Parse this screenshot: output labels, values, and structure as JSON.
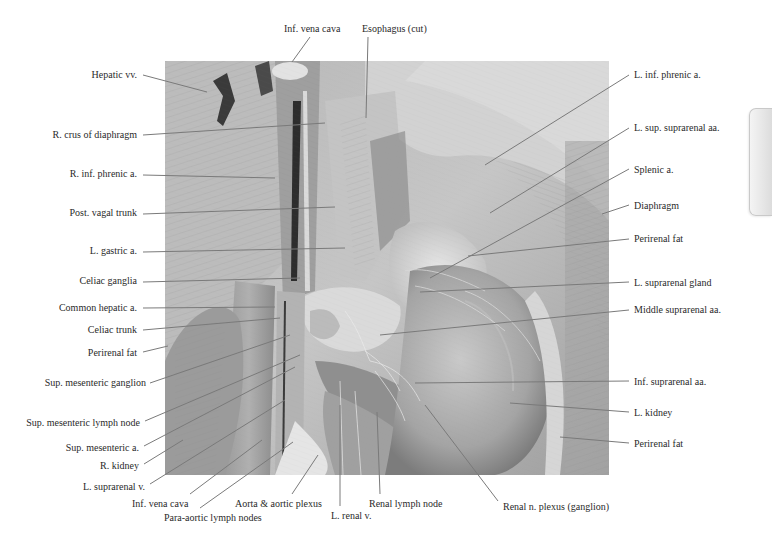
{
  "figure": {
    "type": "anatomical dissection photograph",
    "photo_bounds": {
      "x": 165,
      "y": 61,
      "width": 444,
      "height": 414
    }
  },
  "labels": {
    "top": [
      {
        "text": "Inf. vena cava",
        "x": 284,
        "y": 23,
        "anchor": "left",
        "line": [
          310,
          37,
          292,
          62
        ]
      },
      {
        "text": "Esophagus (cut)",
        "x": 362,
        "y": 23,
        "anchor": "left",
        "line": [
          368,
          37,
          366,
          118
        ]
      }
    ],
    "left": [
      {
        "text": "Hepatic vv.",
        "x": 137,
        "y": 69,
        "anchor": "right",
        "line": [
          143,
          75,
          207,
          92
        ]
      },
      {
        "text": "R. crus of diaphragm",
        "x": 137,
        "y": 129,
        "anchor": "right",
        "line": [
          143,
          135,
          325,
          123
        ]
      },
      {
        "text": "R. inf. phrenic a.",
        "x": 137,
        "y": 168,
        "anchor": "right",
        "line": [
          143,
          175,
          275,
          178
        ]
      },
      {
        "text": "Post. vagal trunk",
        "x": 137,
        "y": 207,
        "anchor": "right",
        "line": [
          143,
          214,
          335,
          207
        ]
      },
      {
        "text": "L. gastric a.",
        "x": 137,
        "y": 245,
        "anchor": "right",
        "line": [
          143,
          252,
          345,
          248
        ]
      },
      {
        "text": "Celiac ganglia",
        "x": 137,
        "y": 275,
        "anchor": "right",
        "line": [
          143,
          282,
          300,
          278
        ]
      },
      {
        "text": "Common hepatic a.",
        "x": 137,
        "y": 302,
        "anchor": "right",
        "line": [
          143,
          308,
          275,
          307
        ]
      },
      {
        "text": "Celiac trunk",
        "x": 137,
        "y": 324,
        "anchor": "right",
        "line": [
          143,
          330,
          280,
          318
        ]
      },
      {
        "text": "Perirenal fat",
        "x": 137,
        "y": 347,
        "anchor": "right",
        "line": [
          143,
          352,
          168,
          346
        ]
      },
      {
        "text": "Sup. mesenteric ganglion",
        "x": 146,
        "y": 377,
        "anchor": "right",
        "line": [
          150,
          383,
          290,
          335
        ]
      },
      {
        "text": "Sup. mesenteric lymph node",
        "x": 140,
        "y": 417,
        "anchor": "right",
        "line": [
          145,
          421,
          300,
          355
        ]
      },
      {
        "text": "Sup. mesenteric a.",
        "x": 139,
        "y": 442,
        "anchor": "right",
        "line": [
          144,
          446,
          295,
          367
        ]
      },
      {
        "text": "R. kidney",
        "x": 139,
        "y": 460,
        "anchor": "right",
        "line": [
          144,
          464,
          183,
          440
        ]
      },
      {
        "text": "L. suprarenal v.",
        "x": 145,
        "y": 481,
        "anchor": "right",
        "line": [
          150,
          484,
          285,
          400
        ]
      }
    ],
    "bottom": [
      {
        "text": "Inf. vena cava",
        "x": 132,
        "y": 498,
        "anchor": "left",
        "line": [
          190,
          494,
          262,
          440
        ]
      },
      {
        "text": "Para-aortic lymph nodes",
        "x": 164,
        "y": 512,
        "anchor": "left",
        "line": [
          200,
          508,
          293,
          442
        ]
      },
      {
        "text": "Aorta & aortic plexus",
        "x": 235,
        "y": 498,
        "anchor": "left",
        "line": [
          292,
          494,
          318,
          455
        ]
      },
      {
        "text": "L. renal v.",
        "x": 331,
        "y": 510,
        "anchor": "left",
        "line": [
          340,
          506,
          340,
          405
        ]
      },
      {
        "text": "Renal lymph node",
        "x": 369,
        "y": 498,
        "anchor": "left",
        "line": [
          380,
          494,
          377,
          412
        ]
      },
      {
        "text": "Renal n. plexus (ganglion)",
        "x": 503,
        "y": 501,
        "anchor": "left",
        "line": [
          498,
          501,
          425,
          405
        ]
      }
    ],
    "right": [
      {
        "text": "L. inf. phrenic a.",
        "x": 634,
        "y": 69,
        "anchor": "left",
        "line": [
          629,
          75,
          485,
          165
        ]
      },
      {
        "text": "L. sup. suprarenal aa.",
        "x": 634,
        "y": 122,
        "anchor": "left",
        "line": [
          629,
          128,
          490,
          213
        ]
      },
      {
        "text": "Splenic a.",
        "x": 634,
        "y": 164,
        "anchor": "left",
        "line": [
          629,
          169,
          430,
          278
        ]
      },
      {
        "text": "Diaphragm",
        "x": 634,
        "y": 200,
        "anchor": "left",
        "line": [
          629,
          205,
          602,
          214
        ]
      },
      {
        "text": "Perirenal fat",
        "x": 634,
        "y": 233,
        "anchor": "left",
        "line": [
          629,
          239,
          468,
          256
        ]
      },
      {
        "text": "L. suprarenal gland",
        "x": 634,
        "y": 277,
        "anchor": "left",
        "line": [
          629,
          282,
          420,
          292
        ]
      },
      {
        "text": "Middle suprarenal aa.",
        "x": 634,
        "y": 304,
        "anchor": "left",
        "line": [
          629,
          310,
          380,
          335
        ]
      },
      {
        "text": "Inf. suprarenal aa.",
        "x": 634,
        "y": 376,
        "anchor": "left",
        "line": [
          629,
          381,
          415,
          383
        ]
      },
      {
        "text": "L. kidney",
        "x": 634,
        "y": 407,
        "anchor": "left",
        "line": [
          629,
          412,
          510,
          403
        ]
      },
      {
        "text": "Perirenal fat",
        "x": 634,
        "y": 438,
        "anchor": "left",
        "line": [
          629,
          443,
          560,
          437
        ]
      }
    ]
  },
  "colors": {
    "leader_line": "#7a7a7a",
    "label_text": "#2a2a2a",
    "photo_base": "#a9a9a9"
  },
  "side_tab": {
    "icon": "page-tab-edge"
  }
}
